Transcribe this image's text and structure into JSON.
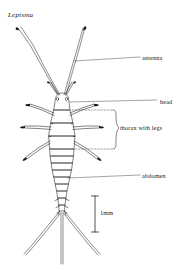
{
  "figure": {
    "title": "Lepisma",
    "organism": "silverfish",
    "view": "dorsal",
    "background_color": "#ffffff",
    "line_color": "#1a1a1a",
    "label_color": "#1a1a1a"
  },
  "labels": {
    "antenna": "antenna",
    "head": "head",
    "thorax": "thorax with legs",
    "abdomen": "abdomen"
  },
  "scale_bar": {
    "label": "1mm",
    "orientation": "vertical"
  }
}
